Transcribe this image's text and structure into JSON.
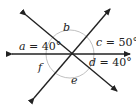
{
  "diagram": {
    "title": "",
    "colors": {
      "line": "#222222",
      "circle": "#b0b0b0",
      "text": "#222222"
    },
    "angles": [
      {
        "name": "a",
        "label_var": "a",
        "label_val": " = 40°"
      },
      {
        "name": "b",
        "label_var": "b",
        "label_val": ""
      },
      {
        "name": "c",
        "label_var": "c",
        "label_val": " = 50°"
      },
      {
        "name": "d",
        "label_var": "d",
        "label_val": " = 40°"
      },
      {
        "name": "e",
        "label_var": "e",
        "label_val": ""
      },
      {
        "name": "f",
        "label_var": "f",
        "label_val": ""
      }
    ]
  }
}
